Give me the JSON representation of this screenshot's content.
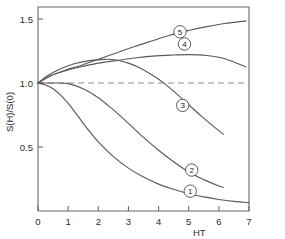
{
  "chart_data": {
    "type": "line",
    "title": "",
    "subtitle": "",
    "xlabel": "HT",
    "ylabel": "S(H)/S(0)",
    "xlim": [
      0,
      7
    ],
    "ylim": [
      0,
      1.6
    ],
    "xticks": [
      0,
      1,
      2,
      3,
      4,
      5,
      6,
      7
    ],
    "xticklabels": [
      "0",
      "1",
      "2",
      "3",
      "4",
      "5",
      "6",
      "7"
    ],
    "yticks": [
      0.5,
      1.0,
      1.5
    ],
    "yticklabels": [
      "0.5",
      "1.0",
      "1.5"
    ],
    "grid": false,
    "legend": "inline-circled-numbers",
    "reference_line": {
      "name": "unity-reference",
      "orientation": "horizontal",
      "y": 1.0,
      "style": "dashed",
      "x_from": 0,
      "x_to": 7
    },
    "series": [
      {
        "name": "1",
        "label": "1",
        "label_x": 5.05,
        "label_y": 0.155,
        "x": [
          0,
          0.25,
          0.5,
          0.75,
          1.0,
          1.25,
          1.5,
          1.75,
          2.0,
          2.5,
          3.0,
          3.5,
          4.0,
          4.5,
          5.0,
          5.5,
          6.0,
          6.5,
          7.0
        ],
        "y": [
          1.0,
          0.985,
          0.955,
          0.905,
          0.84,
          0.765,
          0.685,
          0.61,
          0.54,
          0.425,
          0.335,
          0.265,
          0.21,
          0.17,
          0.135,
          0.11,
          0.09,
          0.075,
          0.065
        ]
      },
      {
        "name": "2",
        "label": "2",
        "label_x": 5.1,
        "label_y": 0.32,
        "x": [
          0,
          0.5,
          1.0,
          1.5,
          2.0,
          2.5,
          3.0,
          3.5,
          4.0,
          4.5,
          5.0,
          5.5,
          6.0,
          6.15
        ],
        "y": [
          1.0,
          1.0,
          0.995,
          0.955,
          0.885,
          0.79,
          0.685,
          0.575,
          0.475,
          0.385,
          0.305,
          0.245,
          0.195,
          0.185
        ]
      },
      {
        "name": "3",
        "label": "3",
        "label_x": 4.8,
        "label_y": 0.825,
        "x": [
          0,
          0.3,
          0.7,
          1.2,
          1.7,
          2.2,
          2.6,
          3.0,
          3.4,
          3.8,
          4.2,
          4.6,
          5.0,
          5.4,
          5.8,
          6.15
        ],
        "y": [
          1.0,
          1.055,
          1.105,
          1.15,
          1.175,
          1.185,
          1.18,
          1.155,
          1.115,
          1.06,
          0.995,
          0.915,
          0.83,
          0.745,
          0.665,
          0.6
        ]
      },
      {
        "name": "4",
        "label": "4",
        "label_x": 4.86,
        "label_y": 1.305,
        "x": [
          0,
          0.4,
          0.9,
          1.4,
          2.0,
          2.6,
          3.2,
          3.8,
          4.4,
          5.0,
          5.6,
          6.2,
          6.9
        ],
        "y": [
          1.0,
          1.055,
          1.095,
          1.125,
          1.155,
          1.175,
          1.195,
          1.21,
          1.218,
          1.222,
          1.215,
          1.19,
          1.125
        ]
      },
      {
        "name": "5",
        "label": "5",
        "label_x": 4.71,
        "label_y": 1.4,
        "x": [
          0,
          0.4,
          0.9,
          1.4,
          2.0,
          2.6,
          3.2,
          3.8,
          4.4,
          5.0,
          5.6,
          6.2,
          6.9
        ],
        "y": [
          1.0,
          1.055,
          1.1,
          1.135,
          1.185,
          1.235,
          1.285,
          1.33,
          1.375,
          1.41,
          1.44,
          1.465,
          1.485
        ]
      }
    ]
  },
  "colors": {
    "curve": "#5a5a5a",
    "axis": "#6b6b6b",
    "reference": "#8c8c8c",
    "text": "#2b2b2b",
    "background": "#ffffff"
  }
}
